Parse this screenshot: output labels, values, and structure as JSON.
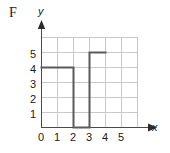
{
  "figure": {
    "panel_letter": "F",
    "axis_labels": {
      "x": "x",
      "y": "y"
    }
  },
  "colors": {
    "grid": "#c9c9c9",
    "axis": "#4a4a4a",
    "curve": "#5a5a5a",
    "text": "#1a1a1a",
    "background": "#ffffff"
  },
  "chart_data": {
    "type": "line",
    "title": "",
    "xlabel": "x",
    "ylabel": "y",
    "xlim": [
      0,
      6
    ],
    "ylim": [
      0,
      6
    ],
    "xticks": [
      "0",
      "1",
      "2",
      "3",
      "4",
      "5"
    ],
    "yticks": [
      "1",
      "2",
      "3",
      "4",
      "5"
    ],
    "grid": true,
    "legend": null,
    "segments": [
      {
        "name": "step-at-4",
        "x": [
          0,
          2
        ],
        "y": [
          4,
          4
        ],
        "orientation": "horizontal"
      },
      {
        "name": "drop-at-x2",
        "x": [
          2,
          2
        ],
        "y": [
          4,
          0
        ],
        "orientation": "vertical"
      },
      {
        "name": "step-at-0",
        "x": [
          2,
          3
        ],
        "y": [
          0,
          0
        ],
        "orientation": "horizontal"
      },
      {
        "name": "rise-at-x3",
        "x": [
          3,
          3
        ],
        "y": [
          0,
          5
        ],
        "orientation": "vertical"
      },
      {
        "name": "step-at-5",
        "x": [
          3,
          4
        ],
        "y": [
          5,
          5
        ],
        "orientation": "horizontal"
      }
    ],
    "points": [
      [
        0,
        4
      ],
      [
        2,
        4
      ],
      [
        2,
        0
      ],
      [
        3,
        0
      ],
      [
        3,
        5
      ],
      [
        4,
        5
      ]
    ]
  }
}
